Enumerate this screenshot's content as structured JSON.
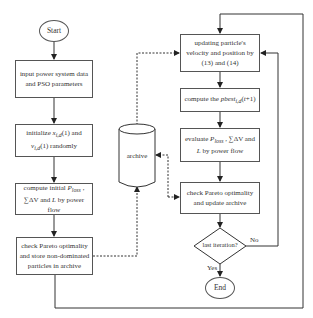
{
  "flowchart": {
    "start": "Start",
    "end": "End",
    "left_column": [
      {
        "id": "input",
        "text": "input power system data and PSO parameters"
      },
      {
        "id": "initialize",
        "text": "initialize x_i,d(1) and v_i,d(1) randomly"
      },
      {
        "id": "compute_initial",
        "text": "compute initial P_loss , ∑ΔV and L by power flow"
      },
      {
        "id": "check_store",
        "text": "check Pareto optimality and store non-dominated particles in archive"
      }
    ],
    "right_column": [
      {
        "id": "update",
        "text": "updating particle's velocity and position by (13) and (14)"
      },
      {
        "id": "pbest",
        "text": "compute the pbest_i,d(t+1)"
      },
      {
        "id": "evaluate",
        "text": "evaluate P_loss , ∑ΔV and L by power flow"
      },
      {
        "id": "check_update",
        "text": "check Pareto optimality and update archive"
      }
    ],
    "archive": "archive",
    "decision": {
      "text": "last iteration?",
      "yes": "Yes",
      "no": "No"
    }
  }
}
